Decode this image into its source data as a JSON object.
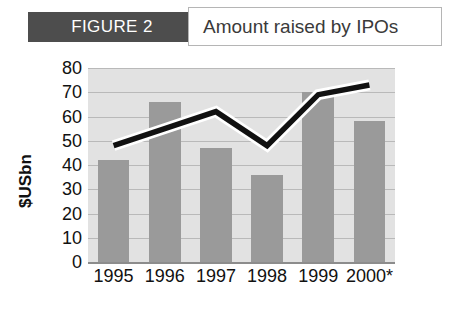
{
  "header": {
    "figure_tag": "FIGURE 2",
    "title": "Amount raised by IPOs",
    "tag_bg_color": "#4d4d4d",
    "tag_text_color": "#ffffff",
    "title_box_border_color": "#b5b5b5"
  },
  "chart_data": {
    "type": "bar",
    "title": "Amount raised by IPOs",
    "xlabel": "",
    "ylabel": "$USbn",
    "categories": [
      "1995",
      "1996",
      "1997",
      "1998",
      "1999",
      "2000*"
    ],
    "ylim": [
      0,
      80
    ],
    "yticks": [
      0,
      10,
      20,
      30,
      40,
      50,
      60,
      70,
      80
    ],
    "grid": true,
    "legend": "none",
    "series": [
      {
        "name": "Amount raised",
        "type": "bar",
        "values": [
          42,
          66,
          47,
          36,
          70,
          58
        ],
        "color": "#9a9a9a"
      },
      {
        "name": "Trend",
        "type": "line",
        "values": [
          48,
          55,
          62,
          48,
          69,
          73
        ],
        "color": "#111111",
        "halo_color": "#ffffff"
      }
    ],
    "plot_bg_color": "#e2e2e2",
    "gridline_color": "#b9b9b9",
    "axis_color": "#8c8c8c"
  }
}
